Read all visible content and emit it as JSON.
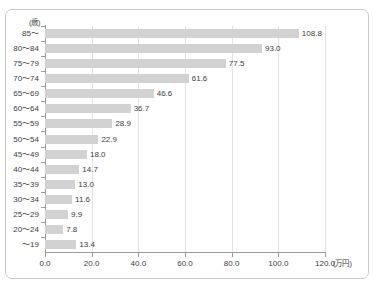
{
  "title_remnant": "",
  "axis": {
    "y_unit": "(歳)",
    "x_unit": "(万円)",
    "x_ticks": [
      "0.0",
      "20.0",
      "40.0",
      "60.0",
      "80.0",
      "100.0",
      "120.0"
    ]
  },
  "colors": {
    "bar": "#d2d2d2",
    "grid": "#e3e3e3",
    "axis": "#9a9a9a",
    "text": "#3c3c3c",
    "frame": "#c8c8c8"
  },
  "chart_data": {
    "type": "bar",
    "orientation": "horizontal",
    "title": "",
    "xlabel": "(万円)",
    "ylabel": "(歳)",
    "xlim": [
      0.0,
      120.0
    ],
    "xticks": [
      0.0,
      20.0,
      40.0,
      60.0,
      80.0,
      100.0,
      120.0
    ],
    "grid": true,
    "legend": false,
    "categories": [
      "85～",
      "80～84",
      "75～79",
      "70～74",
      "65～69",
      "60～64",
      "55～59",
      "50～54",
      "45～49",
      "40～44",
      "35～39",
      "30～34",
      "25～29",
      "20～24",
      "～19"
    ],
    "values": [
      108.8,
      93.0,
      77.5,
      61.6,
      46.6,
      36.7,
      28.9,
      22.9,
      18.0,
      14.7,
      13.0,
      11.6,
      9.9,
      7.8,
      13.4
    ],
    "value_labels": [
      "108.8",
      "93.0",
      "77.5",
      "61.6",
      "46.6",
      "36.7",
      "28.9",
      "22.9",
      "18.0",
      "14.7",
      "13.0",
      "11.6",
      "9.9",
      "7.8",
      "13.4"
    ]
  }
}
